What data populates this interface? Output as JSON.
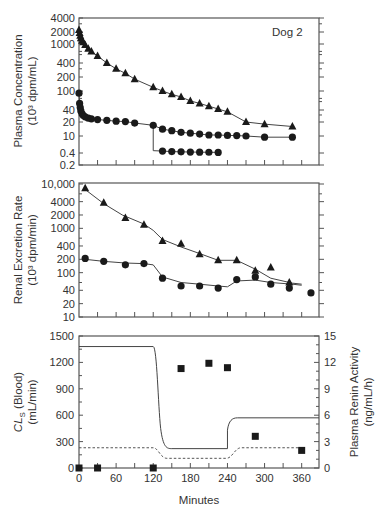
{
  "chart_data": [
    {
      "type": "scatter",
      "panel": "top",
      "title": "",
      "annotation": "Dog 2",
      "xlabel": "",
      "ylabel": "Plasma Concentration",
      "ylabel_units": "(10³ dpm/mL)",
      "yscale": "log (broken)",
      "ytick_labels": [
        "4000",
        "2000",
        "1000",
        "400",
        "200",
        "100",
        "40",
        "20",
        "10",
        "0.4",
        "0.2"
      ],
      "xlim": [
        0,
        390
      ],
      "series": [
        {
          "name": "triangle series",
          "marker": "triangle",
          "x": [
            0,
            1,
            2,
            3,
            5,
            7,
            10,
            15,
            20,
            30,
            45,
            60,
            75,
            90,
            120,
            135,
            150,
            165,
            180,
            195,
            210,
            225,
            240,
            270,
            300,
            345
          ],
          "y": [
            2200,
            1900,
            1600,
            1400,
            1200,
            1100,
            950,
            800,
            700,
            560,
            400,
            300,
            240,
            180,
            120,
            100,
            85,
            75,
            62,
            55,
            48,
            42,
            36,
            20,
            18,
            16
          ]
        },
        {
          "name": "circle series (upper)",
          "marker": "circle",
          "x": [
            0,
            1,
            2,
            3,
            5,
            7,
            10,
            15,
            20,
            30,
            45,
            60,
            75,
            90,
            120,
            135,
            150,
            165,
            180,
            195,
            210,
            225,
            240,
            255,
            270,
            300,
            345
          ],
          "y": [
            90,
            55,
            45,
            38,
            32,
            29,
            27,
            25,
            24,
            23,
            22,
            21,
            20.5,
            19,
            17,
            14,
            13,
            12,
            11.5,
            11,
            10.5,
            10.5,
            10.3,
            10.2,
            10,
            8,
            8
          ]
        },
        {
          "name": "circle series (lower branch)",
          "marker": "circle",
          "x": [
            135,
            150,
            165,
            180,
            195,
            210,
            225
          ],
          "y": [
            0.58,
            0.52,
            0.5,
            0.48,
            0.47,
            0.46,
            0.45
          ]
        }
      ]
    },
    {
      "type": "scatter",
      "panel": "middle",
      "xlabel": "",
      "ylabel": "Renal Excretion Rate",
      "ylabel_units": "(10³ dpm/min)",
      "yscale": "log",
      "ytick_labels": [
        "10,000",
        "4000",
        "2000",
        "1000",
        "400",
        "200",
        "100",
        "40",
        "20",
        "10"
      ],
      "ylim": [
        10,
        10000
      ],
      "xlim": [
        0,
        390
      ],
      "series": [
        {
          "name": "triangle series",
          "marker": "triangle",
          "x": [
            10,
            40,
            75,
            105,
            135,
            165,
            195,
            225,
            255,
            285,
            310,
            340
          ],
          "y": [
            8000,
            3800,
            1700,
            1200,
            520,
            450,
            260,
            190,
            190,
            110,
            130,
            60
          ]
        },
        {
          "name": "circle series",
          "marker": "circle",
          "x": [
            10,
            40,
            75,
            105,
            135,
            165,
            195,
            225,
            255,
            285,
            310,
            340,
            375
          ],
          "y": [
            210,
            180,
            150,
            160,
            75,
            50,
            50,
            45,
            70,
            80,
            55,
            45,
            35
          ]
        }
      ]
    },
    {
      "type": "line",
      "panel": "bottom",
      "xlabel": "Minutes",
      "ylabel_left": "CLs (Blood)",
      "ylabel_left_units": "(mL/min)",
      "ylabel_right": "Plasma Renin Activity",
      "ylabel_right_units": "(ng/mL/h)",
      "xticks": [
        0,
        60,
        120,
        180,
        240,
        300,
        360
      ],
      "yticks_left": [
        0,
        300,
        600,
        900,
        1200,
        1500
      ],
      "yticks_right": [
        0,
        3,
        6,
        9,
        12,
        15
      ],
      "ylim_left": [
        0,
        1500
      ],
      "ylim_right": [
        0,
        15
      ],
      "xlim": [
        0,
        390
      ],
      "series": [
        {
          "name": "CLs solid",
          "style": "solid",
          "x": [
            0,
            120,
            128,
            133,
            140,
            150,
            240,
            243,
            250,
            260,
            390
          ],
          "y": [
            1380,
            1380,
            1000,
            500,
            260,
            220,
            220,
            450,
            540,
            570,
            570
          ]
        },
        {
          "name": "CLs dashed",
          "style": "dashed",
          "x": [
            0,
            120,
            130,
            140,
            240,
            250,
            260,
            360
          ],
          "y": [
            230,
            230,
            150,
            110,
            110,
            180,
            230,
            230
          ]
        },
        {
          "name": "Plasma Renin Activity",
          "marker": "square",
          "axis": "right",
          "x": [
            0,
            30,
            120,
            165,
            210,
            240,
            285,
            360
          ],
          "y": [
            0,
            0,
            0,
            11.3,
            11.9,
            11.4,
            3.6,
            2
          ]
        }
      ]
    }
  ],
  "labels": {
    "dog": "Dog 2",
    "top_ylabel": "Plasma Concentration",
    "top_yunits": "(10³ dpm/mL)",
    "mid_ylabel": "Renal Excretion Rate",
    "mid_yunits": "(10³ dpm/min)",
    "bot_ylabel_left_a": "CL",
    "bot_ylabel_left_sub": "S",
    "bot_ylabel_left_b": " (Blood)",
    "bot_yunits_left": "(mL/min)",
    "bot_ylabel_right": "Plasma Renin Activity",
    "bot_yunits_right": "(ng/mL/h)",
    "xlabel": "Minutes"
  }
}
